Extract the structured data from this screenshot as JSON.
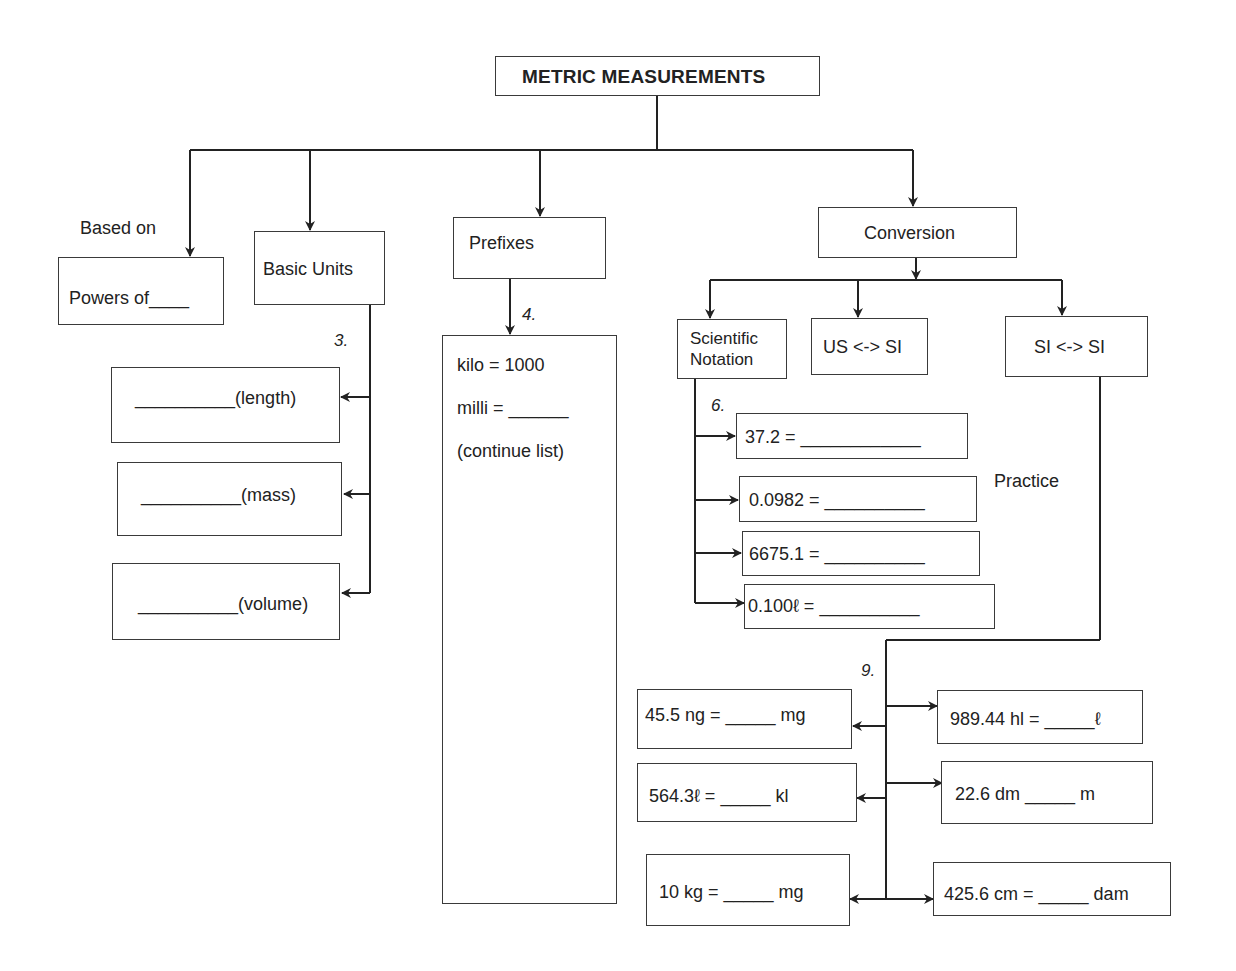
{
  "title": "METRIC MEASUREMENTS",
  "branches": {
    "based_on": {
      "caption": "Based on",
      "box": "Powers of____"
    },
    "basic_units": {
      "label": "Basic Units",
      "item_number": "3.",
      "items": [
        "__________(length)",
        "__________(mass)",
        "__________(volume)"
      ]
    },
    "prefixes": {
      "label": "Prefixes",
      "item_number": "4.",
      "list": [
        "kilo = 1000",
        "milli = ______",
        "(continue list)"
      ]
    },
    "conversion": {
      "label": "Conversion",
      "children": {
        "scientific_notation": {
          "label_line1": "Scientific",
          "label_line2": "Notation",
          "item_number": "6.",
          "items": [
            "37.2 = ____________",
            "0.0982 = __________",
            "6675.1 =  __________",
            "0.100ℓ =  __________"
          ]
        },
        "us_si": {
          "label": "US <-> SI"
        },
        "si_si": {
          "label": "SI <-> SI",
          "item_number": "9.",
          "left_items": [
            "45.5 ng = _____  mg",
            "564.3ℓ =  _____  kl",
            "10 kg =  _____  mg"
          ],
          "right_items": [
            "989.44 hl = _____ℓ",
            "22.6 dm _____  m",
            "425.6 cm = _____ dam"
          ]
        }
      },
      "practice_label": "Practice"
    }
  }
}
